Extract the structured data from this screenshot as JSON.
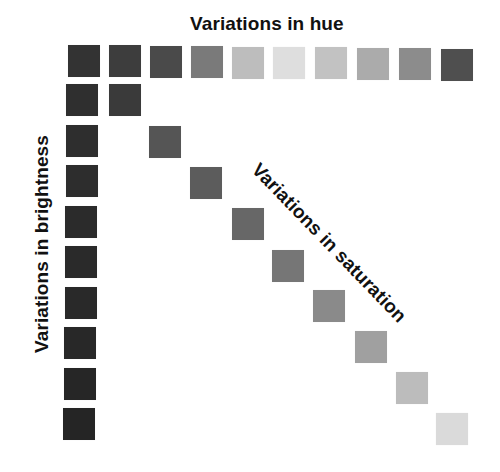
{
  "diagram": {
    "title_hue": "Variations in hue",
    "title_brightness": "Variations in brightness",
    "title_saturation": "Variations in saturation",
    "hue_row": [
      {
        "x": 68,
        "y": 45,
        "color": "#333333"
      },
      {
        "x": 109,
        "y": 45,
        "color": "#3d3d3d"
      },
      {
        "x": 150,
        "y": 46,
        "color": "#4a4a4a"
      },
      {
        "x": 191,
        "y": 46,
        "color": "#7a7a7a"
      },
      {
        "x": 232,
        "y": 47,
        "color": "#bdbdbd"
      },
      {
        "x": 273,
        "y": 47,
        "color": "#dedede"
      },
      {
        "x": 315,
        "y": 47,
        "color": "#c2c2c2"
      },
      {
        "x": 357,
        "y": 48,
        "color": "#ababab"
      },
      {
        "x": 399,
        "y": 48,
        "color": "#8c8c8c"
      },
      {
        "x": 441,
        "y": 49,
        "color": "#4f4f4f"
      }
    ],
    "brightness_column": [
      {
        "x": 66,
        "y": 84,
        "color": "#2f2f2f"
      },
      {
        "x": 66,
        "y": 125,
        "color": "#2e2e2e"
      },
      {
        "x": 66,
        "y": 165,
        "color": "#2d2d2d"
      },
      {
        "x": 65,
        "y": 206,
        "color": "#2b2b2b"
      },
      {
        "x": 65,
        "y": 246,
        "color": "#2a2a2a"
      },
      {
        "x": 65,
        "y": 287,
        "color": "#292929"
      },
      {
        "x": 64,
        "y": 327,
        "color": "#282828"
      },
      {
        "x": 64,
        "y": 368,
        "color": "#262626"
      },
      {
        "x": 63,
        "y": 408,
        "color": "#252525"
      }
    ],
    "saturation_diagonal": [
      {
        "x": 109,
        "y": 84,
        "color": "#3a3a3a"
      },
      {
        "x": 149,
        "y": 126,
        "color": "#555555"
      },
      {
        "x": 190,
        "y": 167,
        "color": "#5c5c5c"
      },
      {
        "x": 232,
        "y": 208,
        "color": "#676767"
      },
      {
        "x": 272,
        "y": 250,
        "color": "#767676"
      },
      {
        "x": 313,
        "y": 290,
        "color": "#8a8a8a"
      },
      {
        "x": 355,
        "y": 331,
        "color": "#a0a0a0"
      },
      {
        "x": 396,
        "y": 372,
        "color": "#bcbcbc"
      },
      {
        "x": 436,
        "y": 413,
        "color": "#dadada"
      }
    ]
  }
}
